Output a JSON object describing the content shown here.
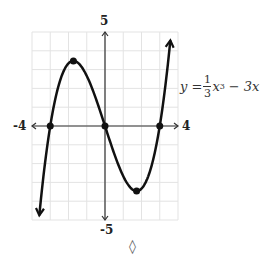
{
  "chart_data": {
    "type": "line",
    "title": "",
    "equation": "y = (1/3)x^3 - 3x",
    "xlabel": "",
    "ylabel": "",
    "xlim": [
      -4,
      4
    ],
    "ylim": [
      -5,
      5
    ],
    "grid": true,
    "tick_labels": {
      "x_min": "-4",
      "x_max": "4",
      "y_max": "5",
      "y_min": "-5"
    },
    "series": [
      {
        "name": "y = 1/3 x^3 - 3x",
        "function": "x^3/3 - 3*x",
        "x_range": [
          -3.6,
          3.58
        ],
        "arrows_both_ends": true
      }
    ],
    "marked_points": [
      {
        "x": -3,
        "y": 0,
        "label": "x-intercept"
      },
      {
        "x": 0,
        "y": 0,
        "label": "origin"
      },
      {
        "x": 3,
        "y": 0,
        "label": "x-intercept"
      },
      {
        "x": -1.732,
        "y": 3.464,
        "label": "local max"
      },
      {
        "x": 1.732,
        "y": -3.464,
        "label": "local min"
      }
    ]
  },
  "labels": {
    "y_max": "5",
    "y_min": "-5",
    "x_min": "-4",
    "x_max": "4",
    "eq_lhs": "y =",
    "eq_num": "1",
    "eq_den": "3",
    "eq_var": "x",
    "eq_exp": "3",
    "eq_rest": "− 3x",
    "footer_symbol": "◊"
  },
  "colors": {
    "curve": "#111111",
    "axis": "#333333",
    "grid": "#e3e3e3"
  }
}
